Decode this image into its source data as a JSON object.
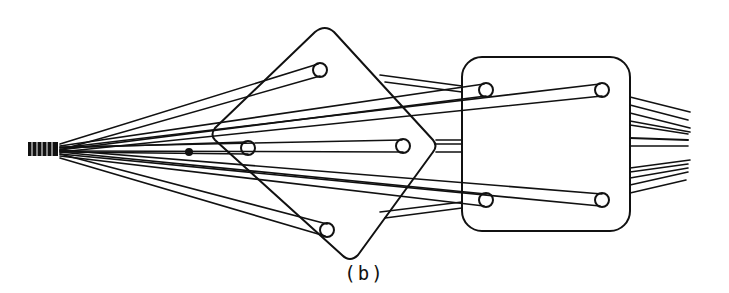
{
  "figure": {
    "caption": "(b)",
    "colors": {
      "line": "#111111",
      "background": "#ffffff"
    }
  }
}
